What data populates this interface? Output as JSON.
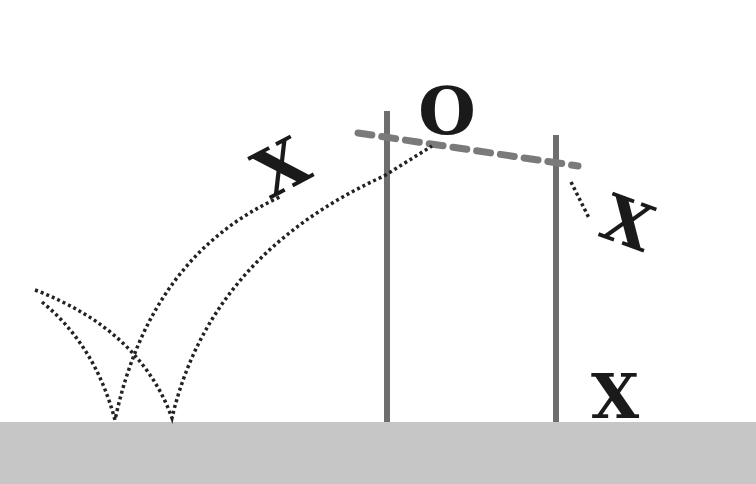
{
  "diagram": {
    "title": "",
    "colors": {
      "background": "#ffffff",
      "ground": "#c6c6c6",
      "pole": "#6e6e6e",
      "bar": "#7a7a7a",
      "trajectory": "#222222",
      "marks": "#1a1a1a"
    },
    "marks": {
      "x_jump": "X",
      "o_top": "O",
      "x_fall": "X",
      "x_ground": "X"
    },
    "elements": [
      {
        "id": "ground",
        "type": "rect",
        "label": ""
      },
      {
        "id": "left-pole",
        "type": "pole"
      },
      {
        "id": "right-pole",
        "type": "pole"
      },
      {
        "id": "crossbar",
        "type": "dashed-line"
      },
      {
        "id": "approach-trajectories",
        "type": "dotted-curves",
        "count": 2
      },
      {
        "id": "fall-trajectory",
        "type": "dotted-line"
      }
    ]
  }
}
